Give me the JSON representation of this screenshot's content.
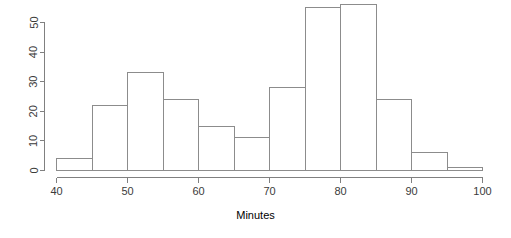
{
  "chart_data": {
    "type": "bar",
    "title": "",
    "subtitle": "",
    "xlabel": "Minutes",
    "ylabel": "",
    "categories": [
      "40-45",
      "45-50",
      "50-55",
      "55-60",
      "60-65",
      "65-70",
      "70-75",
      "75-80",
      "80-85",
      "85-90",
      "90-95",
      "95-100"
    ],
    "bin_edges": [
      40,
      45,
      50,
      55,
      60,
      65,
      70,
      75,
      80,
      85,
      90,
      95,
      100
    ],
    "values": [
      4,
      22,
      33,
      24,
      15,
      11,
      28,
      55,
      56,
      24,
      6,
      1
    ],
    "xlim": [
      40,
      100
    ],
    "ylim": [
      0,
      56
    ],
    "xticks": [
      40,
      50,
      60,
      70,
      80,
      90,
      100
    ],
    "xtick_labels": [
      "40",
      "50",
      "60",
      "70",
      "80",
      "90",
      "100"
    ],
    "yticks": [
      0,
      10,
      20,
      30,
      40,
      50
    ],
    "ytick_labels": [
      "0",
      "10",
      "20",
      "30",
      "40",
      "50"
    ],
    "grid": false,
    "legend": null,
    "bar_fill_color": "#ffffff",
    "bar_border_color": "#8c8c8c",
    "axis_color": "#808080",
    "text_color": "#3b3b3b",
    "background_color": "#ffffff"
  },
  "figure": {
    "x_axis_title": "Minutes"
  }
}
